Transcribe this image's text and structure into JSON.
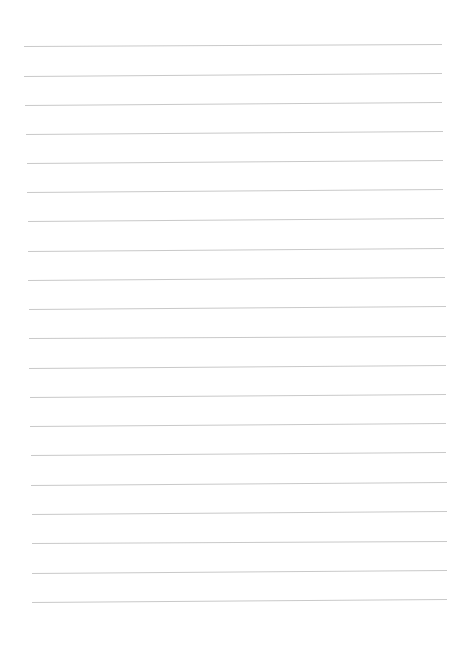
{
  "page": {
    "type": "lined-paper",
    "background_color": "#ffffff",
    "line_color": "#c9c9c9",
    "line_count": 20,
    "lines": [
      {
        "left_x": 24,
        "left_y": 46,
        "right_x": 442,
        "right_y": 44
      },
      {
        "left_x": 24,
        "left_y": 76,
        "right_x": 442,
        "right_y": 73
      },
      {
        "left_x": 25,
        "left_y": 105,
        "right_x": 442,
        "right_y": 102
      },
      {
        "left_x": 26,
        "left_y": 134,
        "right_x": 443,
        "right_y": 131
      },
      {
        "left_x": 27,
        "left_y": 163,
        "right_x": 443,
        "right_y": 160
      },
      {
        "left_x": 27,
        "left_y": 192,
        "right_x": 443,
        "right_y": 189
      },
      {
        "left_x": 28,
        "left_y": 221,
        "right_x": 444,
        "right_y": 218
      },
      {
        "left_x": 28,
        "left_y": 251,
        "right_x": 444,
        "right_y": 248
      },
      {
        "left_x": 28,
        "left_y": 280,
        "right_x": 445,
        "right_y": 277
      },
      {
        "left_x": 29,
        "left_y": 309,
        "right_x": 446,
        "right_y": 306
      },
      {
        "left_x": 29,
        "left_y": 338,
        "right_x": 446,
        "right_y": 336
      },
      {
        "left_x": 29,
        "left_y": 368,
        "right_x": 446,
        "right_y": 365
      },
      {
        "left_x": 30,
        "left_y": 397,
        "right_x": 446,
        "right_y": 394
      },
      {
        "left_x": 30,
        "left_y": 426,
        "right_x": 446,
        "right_y": 423
      },
      {
        "left_x": 31,
        "left_y": 455,
        "right_x": 446,
        "right_y": 452
      },
      {
        "left_x": 31,
        "left_y": 485,
        "right_x": 447,
        "right_y": 482
      },
      {
        "left_x": 32,
        "left_y": 514,
        "right_x": 447,
        "right_y": 511
      },
      {
        "left_x": 32,
        "left_y": 543,
        "right_x": 447,
        "right_y": 541
      },
      {
        "left_x": 32,
        "left_y": 573,
        "right_x": 447,
        "right_y": 570
      },
      {
        "left_x": 32,
        "left_y": 602,
        "right_x": 447,
        "right_y": 599
      }
    ]
  }
}
